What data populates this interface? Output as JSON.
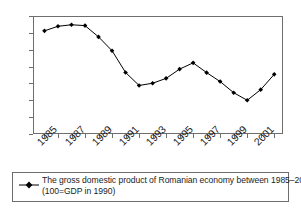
{
  "chart_data": {
    "type": "line",
    "title": "",
    "xlabel": "",
    "ylabel": "",
    "ylim": [
      50,
      120
    ],
    "ytick_labels": [
      "120",
      "110",
      "100",
      "90",
      "80",
      "70",
      "60",
      "50"
    ],
    "ytick_values": [
      120,
      110,
      100,
      90,
      80,
      70,
      60,
      50
    ],
    "grid": false,
    "legend_position": "bottom",
    "x": [
      1985,
      1986,
      1987,
      1988,
      1989,
      1990,
      1991,
      1992,
      1993,
      1994,
      1995,
      1996,
      1997,
      1998,
      1999,
      2000,
      2001,
      2002
    ],
    "xtick_labels": [
      "1985",
      "1987",
      "1989",
      "1991",
      "1993",
      "1995",
      "1997",
      "1999",
      "2001"
    ],
    "xtick_values": [
      1985,
      1987,
      1989,
      1991,
      1993,
      1995,
      1997,
      1999,
      2001
    ],
    "series": [
      {
        "name": "The gross domestic product of Romanian economy between 1985–2002 (100=GDP in 1990)",
        "marker": "filled-diamond",
        "color": "#000000",
        "values": [
          111.2,
          113.9,
          114.8,
          114.3,
          107.6,
          99.4,
          86.5,
          78.8,
          80.1,
          83.0,
          88.5,
          92.2,
          86.4,
          81.1,
          74.5,
          70.0,
          76.3,
          85.4
        ]
      }
    ],
    "annotations": []
  },
  "legend": {
    "line1": "The gross domestic product of Romanian economy between 1985–2002",
    "line2": "(100=GDP in 1990)",
    "marker_name": "series-marker"
  }
}
